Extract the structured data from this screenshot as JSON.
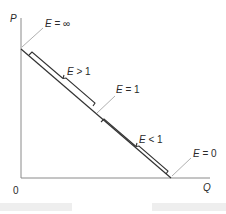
{
  "diagram": {
    "type": "linear-demand-elasticity",
    "axes": {
      "y_label": "P",
      "x_label": "Q",
      "origin_label": "0"
    },
    "annotations": {
      "e_infinity": "E = ∞",
      "e_greater": "E > 1",
      "e_unit": "E = 1",
      "e_less": "E < 1",
      "e_zero": "E = 0"
    },
    "colors": {
      "curve": "#333333",
      "axis": "#888888",
      "leader": "#aaaaaa",
      "text": "#2a2a2a"
    }
  }
}
